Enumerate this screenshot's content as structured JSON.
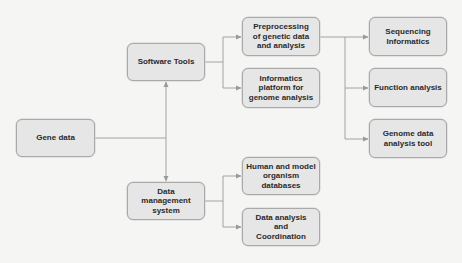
{
  "diagram": {
    "type": "flowchart",
    "colors": {
      "background": "#f5f5f4",
      "node_fill": "#e6e6e6",
      "node_border": "#a9a9a9",
      "connector": "#9a9a9a",
      "text": "#2a2a2a"
    },
    "nodes": {
      "gene_data": "Gene data",
      "software_tools": "Software Tools",
      "data_management": "Data management system",
      "preprocessing": "Preprocessing of genetic data and analysis",
      "informatics_platform": "Informatics platform for genome analysis",
      "human_model_db": "Human and model organism databases",
      "data_analysis_coord": "Data analysis and Coordination",
      "sequencing_informatics": "Sequencing Informatics",
      "function_analysis": "Function analysis",
      "genome_tool": "Genome data analysis tool"
    },
    "edges": [
      {
        "from": "Gene data",
        "to": "Software Tools"
      },
      {
        "from": "Gene data",
        "to": "Data management system"
      },
      {
        "from": "Software Tools",
        "to": "Preprocessing of genetic data and analysis"
      },
      {
        "from": "Software Tools",
        "to": "Informatics platform for genome analysis"
      },
      {
        "from": "Data management system",
        "to": "Human and model organism databases"
      },
      {
        "from": "Data management system",
        "to": "Data analysis and Coordination"
      },
      {
        "from": "Preprocessing of genetic data and analysis",
        "to": "Sequencing Informatics"
      },
      {
        "from": "Preprocessing of genetic data and analysis",
        "to": "Function analysis"
      },
      {
        "from": "Preprocessing of genetic data and analysis",
        "to": "Genome data analysis tool"
      }
    ]
  }
}
